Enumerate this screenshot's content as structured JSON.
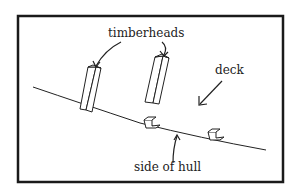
{
  "diagram": {
    "labels": {
      "timberheads": "timberheads",
      "deck": "deck",
      "side_of_hull": "side of hull"
    },
    "colors": {
      "border": "#1a1a1a",
      "stroke": "#222222",
      "background": "#ffffff"
    }
  }
}
